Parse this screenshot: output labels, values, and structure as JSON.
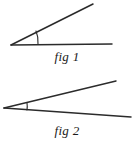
{
  "figure_set": {
    "title": "Two angle diagrams",
    "background_color": "#ffffff",
    "stroke_color": "#2b2b2b",
    "width": 134,
    "height": 147
  },
  "figures": [
    {
      "id": "fig-1",
      "caption": "fig 1",
      "description": "An acute angle opening upward to the right, vertex at lower left, with an arc marking the angle",
      "vertex": {
        "x": 11,
        "y": 45
      },
      "rays": [
        {
          "name": "baseline-ray",
          "from": {
            "x": 11,
            "y": 45
          },
          "to": {
            "x": 112,
            "y": 44
          }
        },
        {
          "name": "upper-ray",
          "from": {
            "x": 11,
            "y": 45
          },
          "to": {
            "x": 93,
            "y": 4
          }
        }
      ],
      "angle_arc": {
        "name": "angle-arc",
        "radius": 27,
        "start": {
          "x": 36,
          "y": 31
        },
        "end": {
          "x": 38,
          "y": 44
        }
      }
    },
    {
      "id": "fig-2",
      "caption": "fig 2",
      "description": "A narrow acute angle opening to the right, vertex at far left, with a short arc marking the angle",
      "vertex": {
        "x": 4,
        "y": 108
      },
      "rays": [
        {
          "name": "upper-ray",
          "from": {
            "x": 4,
            "y": 108
          },
          "to": {
            "x": 116,
            "y": 81
          }
        },
        {
          "name": "lower-ray",
          "from": {
            "x": 4,
            "y": 108
          },
          "to": {
            "x": 131,
            "y": 117
          }
        }
      ],
      "angle_arc": {
        "name": "angle-arc",
        "radius": 23,
        "start": {
          "x": 27,
          "y": 103
        },
        "end": {
          "x": 27,
          "y": 110
        }
      }
    }
  ]
}
